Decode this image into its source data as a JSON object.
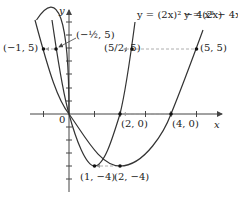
{
  "diagram": {
    "axes": {
      "x_label": "x",
      "y_label": "y",
      "origin_label": "0"
    },
    "curves": [
      {
        "name": "f",
        "equation_label": "y = x² − 4x"
      },
      {
        "name": "g",
        "equation_label": "y = (2x)² − 4(2x)"
      }
    ],
    "points": [
      {
        "label": "(−1, 5)"
      },
      {
        "label": "(−½, 5)"
      },
      {
        "label": "(5/2, 5)"
      },
      {
        "label": "(5, 5)"
      },
      {
        "label": "(2, 0)"
      },
      {
        "label": "(4, 0)"
      },
      {
        "label": "(1, −4)"
      },
      {
        "label": "(2, −4)"
      }
    ],
    "colors": {
      "curve": "#333333",
      "axis": "#444444",
      "dashed": "#999999"
    }
  }
}
